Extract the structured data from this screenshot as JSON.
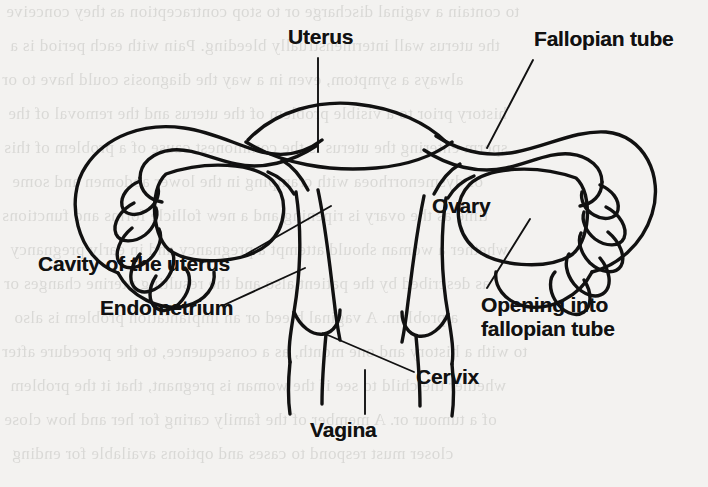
{
  "figure": {
    "type": "anatomical-line-diagram",
    "background_color": "#f3f2f0",
    "ink_color": "#111111",
    "labels": {
      "uterus": "Uterus",
      "fallopian_tube": "Fallopian tube",
      "ovary": "Ovary",
      "cavity_of_the_uterus": "Cavity of the uterus",
      "endometrium": "Endometrium",
      "opening_into_fallopian_tube_line1": "Opening into",
      "opening_into_fallopian_tube_line2": "fallopian tube",
      "cervix": "Cervix",
      "vagina": "Vagina"
    }
  },
  "bleed_text": {
    "note": "faint mirrored show-through text from the reverse side of the scanned page",
    "lines": [
      "to contain a vaginal discharge or to stop contraception as they conceive",
      "the uterus wall intermenstrually bleeding. Pain with each period is a",
      "always a symptom, even in a way the diagnosis could have to or",
      "history prior to a visible problem of the uterus and the removal of the",
      "sperm entering the uterus is the commonest cause of a problem of this",
      "of dysmenorrhoea with cramping in the lower abdomen and some",
      "time as the ovary is ripening and a new follicle forms and functions",
      "whether a woman should attempt a pregnancy and in early pregnancy",
      "as described by the patient also and the resulting uterine changes or",
      "a problem. A vaginal bleed or an implantation problem is also",
      "to with a history and one month, as a consequence, to the procedure after",
      "whether the child to see if the woman is pregnant, that it the problem",
      "of a tumour or. A member of the family caring for her and how close",
      "closer must respond to cases and options available for ending"
    ]
  }
}
